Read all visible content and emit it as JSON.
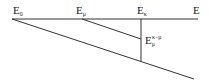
{
  "diagram": {
    "type": "energy-line-diagram",
    "stroke_color": "#333333",
    "labels": {
      "e0": {
        "base": "E",
        "sub": "0"
      },
      "emu": {
        "base": "E",
        "sub": "μ"
      },
      "ekappa": {
        "base": "E",
        "sub": "κ"
      },
      "e": {
        "base": "E"
      },
      "emu_kappa": {
        "base": "E",
        "sub": "μ",
        "sup": "κ−μ"
      }
    }
  }
}
